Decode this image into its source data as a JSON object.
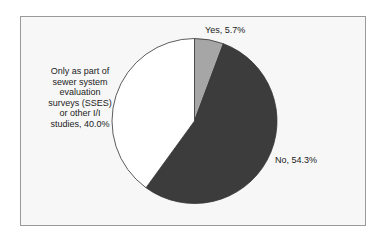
{
  "chart_data": {
    "type": "pie",
    "title": "",
    "categories": [
      "Yes",
      "No",
      "Only as part of sewer system evaluation surveys (SSES) or other I/I studies"
    ],
    "values": [
      5.7,
      54.3,
      40.0
    ],
    "unit": "%",
    "colors": [
      "#a6a6a6",
      "#3c3c3c",
      "#ffffff"
    ],
    "start_angle_deg": 0,
    "direction": "clockwise",
    "legend": "none",
    "data_labels": [
      "Yes, 5.7%",
      "No, 54.3%",
      "Only as part of sewer system evaluation surveys (SSES) or other I/I studies, 40.0%"
    ]
  },
  "labels": {
    "yes": "Yes, 5.7%",
    "no": "No, 54.3%",
    "only_lines": [
      "Only as part of",
      "sewer system",
      "evaluation",
      "surveys (SSES)",
      "or other I/I",
      "studies, 40.0%"
    ]
  },
  "style": {
    "frame_background": "#f7f7f7",
    "frame_border": "#9a9a9a",
    "slice_outline": "#333333"
  }
}
